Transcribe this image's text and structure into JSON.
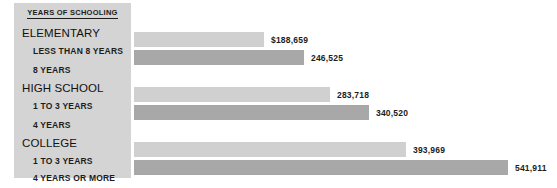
{
  "chart_data": {
    "type": "bar",
    "title": "",
    "xlabel": "",
    "ylabel": "Years of Schooling",
    "orientation": "horizontal",
    "grid": false,
    "legend_position": "left-panel",
    "legend_heading": "YEARS OF SCHOOLING",
    "value_prefix": "$",
    "xlim": [
      0,
      560000
    ],
    "groups": [
      {
        "group_label": "ELEMENTARY",
        "rows": [
          {
            "category": "LESS THAN 8 YEARS",
            "value": 188659,
            "value_text": "$188,659",
            "shade": "light"
          },
          {
            "category": "8 YEARS",
            "value": 246525,
            "value_text": "246,525",
            "shade": "dark"
          }
        ]
      },
      {
        "group_label": "HIGH SCHOOL",
        "rows": [
          {
            "category": "1 TO 3 YEARS",
            "value": 283718,
            "value_text": "283,718",
            "shade": "light"
          },
          {
            "category": "4 YEARS",
            "value": 340520,
            "value_text": "340,520",
            "shade": "dark"
          }
        ]
      },
      {
        "group_label": "COLLEGE",
        "rows": [
          {
            "category": "1 TO 3 YEARS",
            "value": 393969,
            "value_text": "393,969",
            "shade": "light"
          },
          {
            "category": "4 YEARS OR MORE",
            "value": 541911,
            "value_text": "541,911",
            "shade": "dark"
          }
        ]
      }
    ],
    "categories": [
      "LESS THAN 8 YEARS",
      "8 YEARS",
      "1 TO 3 YEARS",
      "4 YEARS",
      "1 TO 3 YEARS",
      "4 YEARS OR MORE"
    ],
    "values": [
      188659,
      246525,
      283718,
      340520,
      393969,
      541911
    ],
    "colors": {
      "bar_light": "#d0d0d0",
      "bar_dark": "#a8a8a8",
      "panel_background": "#d4d4d4",
      "page_background": "#ffffff",
      "text": "#1c1c1c"
    }
  },
  "legend": {
    "heading": "YEARS OF SCHOOLING",
    "headers": [
      {
        "label": "ELEMENTARY"
      },
      {
        "label": "HIGH SCHOOL"
      },
      {
        "label": "COLLEGE"
      }
    ],
    "sub_labels": [
      {
        "label": "LESS THAN 8 YEARS"
      },
      {
        "label": "8 YEARS"
      },
      {
        "label": "1 TO 3 YEARS"
      },
      {
        "label": "4 YEARS"
      },
      {
        "label": "1 TO 3 YEARS"
      },
      {
        "label": "4 YEARS OR MORE"
      }
    ]
  },
  "bars": [
    {
      "value_text": "$188,659"
    },
    {
      "value_text": "246,525"
    },
    {
      "value_text": "283,718"
    },
    {
      "value_text": "340,520"
    },
    {
      "value_text": "393,969"
    },
    {
      "value_text": "541,911"
    }
  ]
}
